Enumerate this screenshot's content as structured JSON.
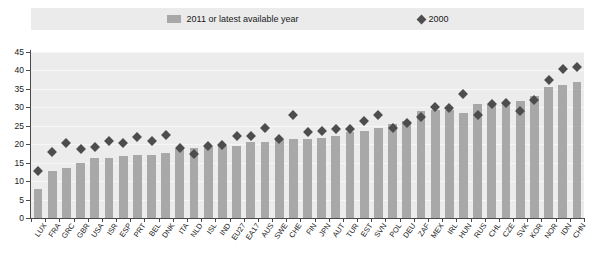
{
  "legend": {
    "bar_label": "2011 or latest available year",
    "dot_label": "2000",
    "bar_color": "#a8a8a8",
    "dot_color": "#4d4d4d",
    "swatch_icon": "bar-swatch-icon",
    "marker_icon": "diamond-marker-icon"
  },
  "chart_data": {
    "type": "bar",
    "title": "",
    "subtitle": "",
    "xlabel": "",
    "ylabel": "",
    "ylim": [
      0,
      45
    ],
    "ytick_step": 5,
    "yticks": [
      0,
      5,
      10,
      15,
      20,
      25,
      30,
      35,
      40,
      45
    ],
    "grid": true,
    "legend_position": "top-center",
    "categories": [
      "LUX",
      "FRA",
      "GRC",
      "GBR",
      "USA",
      "ISR",
      "ESP",
      "PRT",
      "BEL",
      "DNK",
      "ITA",
      "NLD",
      "ISL",
      "IND",
      "EU27",
      "EA17",
      "AUS",
      "SWE",
      "CHE",
      "FIN",
      "JPN",
      "AUT",
      "TUR",
      "EST",
      "SVN",
      "POL",
      "DEU",
      "ZAF",
      "MEX",
      "IRL",
      "HUN",
      "RUS",
      "CHL",
      "CZE",
      "SVK",
      "KOR",
      "NOR",
      "IDN",
      "CHN"
    ],
    "series": [
      {
        "name": "2011 or latest available year",
        "type": "bar",
        "color": "#a8a8a8",
        "values": [
          8.0,
          12.7,
          13.6,
          15.0,
          16.2,
          16.4,
          16.8,
          17.0,
          17.1,
          17.5,
          18.6,
          19.0,
          19.2,
          19.4,
          19.6,
          20.5,
          20.6,
          21.3,
          21.4,
          21.5,
          21.6,
          22.3,
          23.3,
          23.6,
          24.3,
          25.6,
          26.3,
          29.0,
          29.3,
          29.4,
          28.5,
          30.8,
          31.0,
          31.0,
          31.6,
          33.0,
          35.5,
          36.0,
          37.0
        ]
      },
      {
        "name": "2000",
        "type": "scatter",
        "color": "#4d4d4d",
        "marker": "diamond",
        "values": [
          12.8,
          17.8,
          20.3,
          18.6,
          19.2,
          20.8,
          20.3,
          21.9,
          21.0,
          22.6,
          19.1,
          17.3,
          19.4,
          19.9,
          22.2,
          22.2,
          24.3,
          21.3,
          28.0,
          23.3,
          23.6,
          24.0,
          24.0,
          26.2,
          28.0,
          24.5,
          25.8,
          27.3,
          30.0,
          29.8,
          33.6,
          27.9,
          30.9,
          31.1,
          29.1,
          32.0,
          37.5,
          40.5,
          41.0
        ]
      }
    ]
  }
}
